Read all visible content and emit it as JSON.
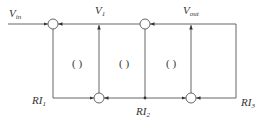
{
  "diagram": {
    "type": "signal-flow block diagram",
    "labels": {
      "vin": {
        "main": "V",
        "sub": "in"
      },
      "v1": {
        "main": "V",
        "sub": "1"
      },
      "vout": {
        "main": "V",
        "sub": "out"
      },
      "ri1": {
        "main": "RI",
        "sub": "1"
      },
      "ri2": {
        "main": "RI",
        "sub": "2"
      },
      "ri3": {
        "main": "RI",
        "sub": "3"
      }
    },
    "blanks": [
      "(   )",
      "(   )",
      "(   )"
    ],
    "summing_junctions": [
      {
        "id": "top-left",
        "cx": 53,
        "cy": 24
      },
      {
        "id": "top-right",
        "cx": 145,
        "cy": 24
      },
      {
        "id": "bottom-left",
        "cx": 99,
        "cy": 98
      },
      {
        "id": "bottom-right",
        "cx": 191,
        "cy": 98
      }
    ],
    "colors": {
      "line": "#555555",
      "text": "#333333",
      "background": "#ffffff"
    }
  }
}
